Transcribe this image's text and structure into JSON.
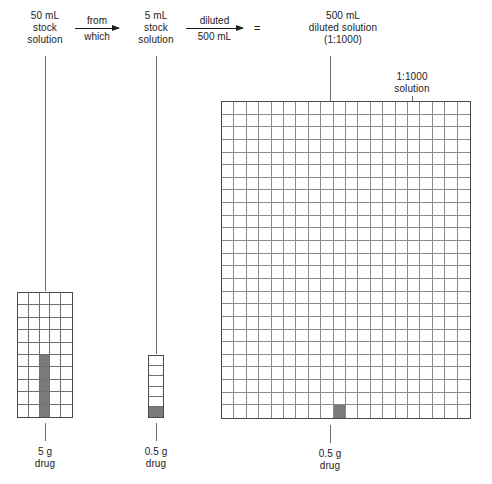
{
  "diagram": {
    "title_flow": "Dilution of a 50 mL stock solution to a 1:1000 diluted solution",
    "nodes": [
      {
        "id": "stock50",
        "label": "50 mL\nstock\nsolution"
      },
      {
        "id": "stock5",
        "label": "5 mL\nstock\nsolution"
      },
      {
        "id": "diluted500",
        "label": "500 mL\ndiluted solution\n(1:1000)"
      }
    ],
    "arrows": [
      {
        "id": "arrow-from-which",
        "above": "from",
        "below": "which"
      },
      {
        "id": "arrow-diluted",
        "above": "diluted",
        "below": "500 mL"
      }
    ],
    "equals_sign": "=",
    "annotation": {
      "id": "ratio-note",
      "label": "1:1000\nsolution"
    },
    "bottom_labels": [
      {
        "id": "left-drug",
        "label": "5 g\ndrug"
      },
      {
        "id": "middle-drug",
        "label": "0.5 g\ndrug"
      },
      {
        "id": "right-drug",
        "label": "0.5 g\ndrug"
      }
    ],
    "grids": [
      {
        "id": "grid-50ml",
        "cols": 5,
        "rows": 10,
        "shaded_cells": [
          27,
          32,
          37,
          42,
          47
        ]
      },
      {
        "id": "grid-5ml",
        "cols": 1,
        "rows": 6,
        "shaded_cells": [
          5
        ]
      },
      {
        "id": "grid-500ml",
        "cols": 20,
        "rows": 25,
        "shaded_cells": [
          489
        ]
      }
    ],
    "colors": {
      "shade": "#7a7a7a",
      "grid_line": "#6f6f6f",
      "fine_grid_line": "#8a8a8a",
      "border": "#4a4a4a",
      "leader": "#6b6b6b",
      "text": "#1c1c1c",
      "background": "#ffffff"
    }
  }
}
